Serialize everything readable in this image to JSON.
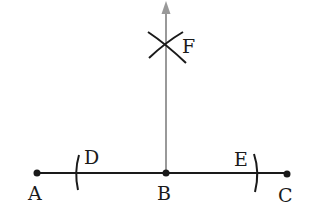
{
  "points": [
    {
      "id": "A",
      "label": "A",
      "x": 37,
      "y": 173,
      "label_x": 28,
      "label_y": 184
    },
    {
      "id": "B",
      "label": "B",
      "x": 166,
      "y": 173,
      "label_x": 157,
      "label_y": 184
    },
    {
      "id": "C",
      "label": "C",
      "x": 287,
      "y": 173,
      "label_x": 278,
      "label_y": 186
    },
    {
      "id": "D",
      "label": "D",
      "x": 77,
      "y": 173,
      "label_x": 84,
      "label_y": 148
    },
    {
      "id": "E",
      "label": "E",
      "x": 256,
      "y": 173,
      "label_x": 234,
      "label_y": 150
    },
    {
      "id": "F",
      "label": "F",
      "x": 166,
      "y": 46,
      "label_x": 182,
      "label_y": 37
    }
  ],
  "colors": {
    "line": "#1a1a1a",
    "perpendicular": "#999999"
  }
}
